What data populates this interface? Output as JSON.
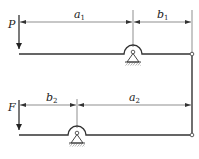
{
  "diagram": {
    "type": "mechanics-two-lever-system",
    "colors": {
      "line": "#333333",
      "background": "#ffffff"
    },
    "top_lever": {
      "force_label": "P",
      "dimensions": [
        {
          "label": "a",
          "subscript": "1"
        },
        {
          "label": "b",
          "subscript": "1"
        }
      ]
    },
    "bottom_lever": {
      "force_label": "F",
      "dimensions": [
        {
          "label": "b",
          "subscript": "2"
        },
        {
          "label": "a",
          "subscript": "2"
        }
      ]
    },
    "connector": "vertical link between right ends"
  }
}
